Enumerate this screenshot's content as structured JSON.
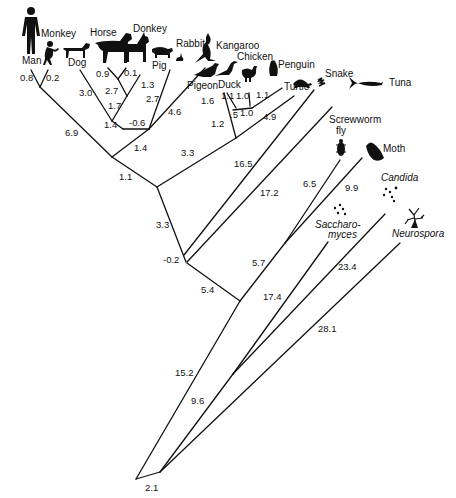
{
  "diagram": {
    "type": "phylogenetic-tree",
    "taxa": [
      {
        "id": "man",
        "label": "Man",
        "icon": "human-silhouette-icon"
      },
      {
        "id": "monkey",
        "label": "Monkey",
        "icon": "monkey-silhouette-icon"
      },
      {
        "id": "dog",
        "label": "Dog",
        "icon": "dog-silhouette-icon"
      },
      {
        "id": "horse",
        "label": "Horse",
        "icon": "horse-silhouette-icon"
      },
      {
        "id": "donkey",
        "label": "Donkey",
        "icon": "donkey-silhouette-icon"
      },
      {
        "id": "pig",
        "label": "Pig",
        "icon": "pig-silhouette-icon"
      },
      {
        "id": "rabbit",
        "label": "Rabbit",
        "icon": "rabbit-silhouette-icon"
      },
      {
        "id": "kangaroo",
        "label": "Kangaroo",
        "icon": "kangaroo-silhouette-icon"
      },
      {
        "id": "pigeon",
        "label": "Pigeon",
        "icon": "pigeon-silhouette-icon"
      },
      {
        "id": "duck",
        "label": "Duck",
        "icon": "duck-silhouette-icon"
      },
      {
        "id": "chicken",
        "label": "Chicken",
        "icon": "chicken-silhouette-icon"
      },
      {
        "id": "penguin",
        "label": "Penguin",
        "icon": "penguin-silhouette-icon"
      },
      {
        "id": "turtle",
        "label": "Turtle",
        "icon": "turtle-silhouette-icon"
      },
      {
        "id": "snake",
        "label": "Snake",
        "icon": "snake-silhouette-icon"
      },
      {
        "id": "tuna",
        "label": "Tuna",
        "icon": "fish-silhouette-icon"
      },
      {
        "id": "fly",
        "label": "Screwworm fly",
        "line1": "Screwworm",
        "line2": "fly",
        "icon": "fly-silhouette-icon"
      },
      {
        "id": "moth",
        "label": "Moth",
        "icon": "moth-silhouette-icon"
      },
      {
        "id": "candida",
        "label": "Candida",
        "icon": "yeast-cells-icon"
      },
      {
        "id": "saccharomyces",
        "label": "Saccharomyces",
        "line1": "Saccharo-",
        "line2": "myces",
        "icon": "yeast-cells-icon"
      },
      {
        "id": "neurospora",
        "label": "Neurospora",
        "icon": "mold-hyphae-icon"
      }
    ],
    "branch_lengths": {
      "man": "0.8",
      "monkey": "0.2",
      "primates_stem": "6.9",
      "dog": "3.0",
      "horse": "0.9",
      "donkey": "0.1",
      "equids_stem": "2.7",
      "pig": "1.3",
      "ungulates_stem": "1.7",
      "dog_ungulates_node": "1.4",
      "rabbit": "2.7",
      "kangaroo": "4.6",
      "rabbit_kangaroo_link": "-0.6",
      "nonprimate_mammals_stem": "1.4",
      "mammals_stem": "1.1",
      "pigeon": "1.6",
      "duck": "1.1",
      "chicken": "1.0",
      "penguin": "1.1",
      "galliform_link": ".5",
      "duck_chicken_stem": "1.0",
      "birds_stem": "1.2",
      "turtle": "4.9",
      "sauropsids_stem": "3.3",
      "amniotes_stem": "3.3",
      "snake": "16.5",
      "tuna": "17.2",
      "snake_node": "-0.2",
      "vertebrates_stem": "5.4",
      "fly": "6.5",
      "moth": "9.9",
      "insects_stem": "5.7",
      "animals_stem": "15.2",
      "saccharomyces": "17.4",
      "candida": "23.4",
      "yeasts_stem": "9.6",
      "neurospora": "28.1",
      "root": "2.1"
    }
  }
}
